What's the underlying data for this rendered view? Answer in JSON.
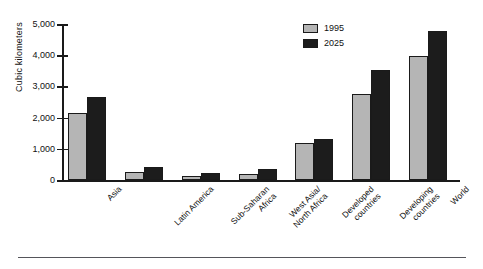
{
  "chart_data": {
    "type": "bar",
    "title": "",
    "subtitle": "",
    "xlabel": "",
    "ylabel": "Cubic kilometers",
    "ylim": [
      0,
      5000
    ],
    "ytick_values": [
      0,
      1000,
      2000,
      3000,
      4000,
      5000
    ],
    "ytick_labels": [
      "0",
      "1,000",
      "2,000",
      "3,000",
      "4,000",
      "5,000"
    ],
    "grid": false,
    "legend_position": "top-right",
    "categories": [
      "Asia",
      "Latin America",
      "Sub-Saharan Africa",
      "West Asia/ North Africa",
      "Developed countries",
      "Developing countries",
      "World"
    ],
    "category_label_lines": [
      [
        "Asia"
      ],
      [
        "Latin America"
      ],
      [
        "Sub-Saharan",
        "Africa"
      ],
      [
        "West Asia/",
        "North Africa"
      ],
      [
        "Developed",
        "countries"
      ],
      [
        "Developing",
        "countries"
      ],
      [
        "World"
      ]
    ],
    "series": [
      {
        "name": "1995",
        "color": "#b5b5b5",
        "values": [
          2150,
          250,
          130,
          200,
          1180,
          2750,
          3970
        ]
      },
      {
        "name": "2025",
        "color": "#1c1c1c",
        "values": [
          2650,
          420,
          220,
          350,
          1320,
          3520,
          4780
        ]
      }
    ]
  },
  "legend": {
    "items": [
      {
        "label": "1995",
        "swatch": "legend-swatch-1995"
      },
      {
        "label": "2025",
        "swatch": "legend-swatch-2025"
      }
    ]
  },
  "colors": {
    "series_1995": "#b5b5b5",
    "series_2025": "#1c1c1c",
    "axis": "#1a1a1a",
    "rule": "#55555a",
    "background": "#ffffff"
  }
}
